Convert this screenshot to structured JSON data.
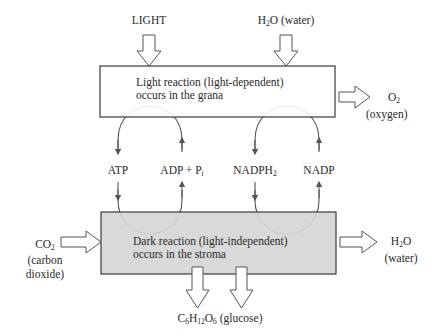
{
  "colors": {
    "line": "#3a3a3a",
    "arc": "#555555",
    "top_box_fill": "#ffffff",
    "bottom_box_fill": "#d6d6d6",
    "text": "#2a2a2a"
  },
  "inputs_top": {
    "light": "LIGHT",
    "water_formula": "H",
    "water_sub": "2",
    "water_rest": "O (water)"
  },
  "light_reaction": {
    "line1": "Light reaction (light-dependent)",
    "line2": "occurs in the grana"
  },
  "oxygen_output": {
    "formula": "O",
    "sub": "2",
    "name": "(oxygen)"
  },
  "cycle_labels": {
    "atp": "ATP",
    "adp": "ADP + P",
    "adp_sub": "i",
    "nadph": "NADPH",
    "nadph_sub": "2",
    "nadp": "NADP"
  },
  "dark_reaction": {
    "line1": "Dark reaction (light-independent)",
    "line2": "occurs in the stroma"
  },
  "co2_input": {
    "formula": "CO",
    "sub": "2",
    "name_line1": "(carbon",
    "name_line2": "dioxide)"
  },
  "water_output": {
    "formula": "H",
    "sub": "2",
    "rest": "O",
    "name": "(water)"
  },
  "glucose_output": {
    "c": "C",
    "c_sub": "6",
    "h": "H",
    "h_sub": "12",
    "o": "O",
    "o_sub": "6",
    "name": " (glucose)"
  }
}
